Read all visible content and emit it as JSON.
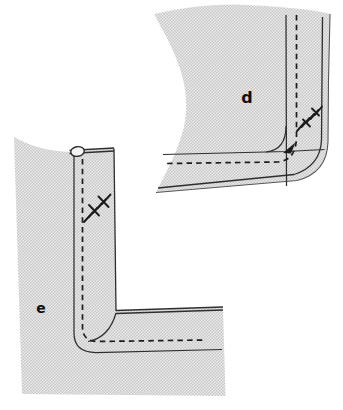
{
  "panels": {
    "d": {
      "label": "d"
    },
    "e": {
      "label": "e"
    }
  },
  "colors": {
    "background": "#ffffff",
    "fabric_base": "#ececec",
    "fabric_dot": "#c6c6c6",
    "line": "#2e2e2e",
    "line_soft": "#565656",
    "mark": "#1c1c1c",
    "label": "#101010"
  }
}
